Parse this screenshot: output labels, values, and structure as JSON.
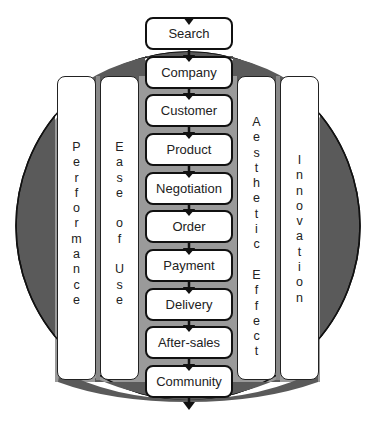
{
  "diagram": {
    "colors": {
      "circle_fill": "#5a5a5a",
      "band_fill": "#9a9a9a",
      "outline": "#111111",
      "box_fill": "#ffffff"
    },
    "process_steps": [
      {
        "label": "Search"
      },
      {
        "label": "Company"
      },
      {
        "label": "Customer"
      },
      {
        "label": "Product"
      },
      {
        "label": "Negotiation"
      },
      {
        "label": "Order"
      },
      {
        "label": "Payment"
      },
      {
        "label": "Delivery"
      },
      {
        "label": "After-sales"
      },
      {
        "label": "Community"
      }
    ],
    "pillars_left": [
      {
        "label": "Performance"
      },
      {
        "label": "Ease of Use"
      }
    ],
    "pillars_right": [
      {
        "label": "Aesthetic Effect"
      },
      {
        "label": "Innovation"
      }
    ]
  }
}
